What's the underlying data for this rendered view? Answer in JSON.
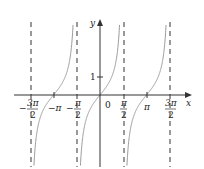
{
  "chart_data": {
    "type": "line",
    "title": "",
    "function": "y = tan x",
    "xlabel": "x",
    "ylabel": "y",
    "x_ticks": [
      {
        "value": -4.712,
        "label": "-3π/2"
      },
      {
        "value": -3.1416,
        "label": "-π"
      },
      {
        "value": -1.5708,
        "label": "-π/2"
      },
      {
        "value": 0,
        "label": "0"
      },
      {
        "value": 1.5708,
        "label": "π/2"
      },
      {
        "value": 3.1416,
        "label": "π"
      },
      {
        "value": 4.712,
        "label": "3π/2"
      }
    ],
    "y_ticks": [
      {
        "value": 1,
        "label": "1"
      }
    ],
    "asymptotes": [
      "-3π/2",
      "-π/2",
      "π/2",
      "3π/2"
    ],
    "xlim": [
      -5.3,
      5.9
    ],
    "ylim": [
      -4,
      4
    ],
    "grid": false,
    "legend": null,
    "series": [
      {
        "name": "tan x",
        "color": "#9a9a9a",
        "branches": [
          {
            "from": "-3π/2",
            "to": "-π/2",
            "zero_at": "-π"
          },
          {
            "from": "-π/2",
            "to": "π/2",
            "zero_at": "0"
          },
          {
            "from": "π/2",
            "to": "3π/2",
            "zero_at": "π"
          }
        ]
      }
    ]
  },
  "labels": {
    "x_axis": "x",
    "y_axis": "y",
    "origin": "0",
    "one": "1",
    "neg_pi": "−π",
    "pi": "π",
    "three": "3π",
    "two": "2",
    "pi_num": "π",
    "minus": "−"
  },
  "colors": {
    "axis": "#333333",
    "curve": "#9a9a9a",
    "asymptote": "#333333"
  }
}
